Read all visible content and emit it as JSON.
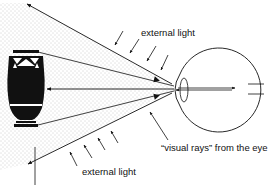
{
  "labels": {
    "external_light_top": "external light",
    "external_light_bottom": "external light",
    "visual_rays": "“visual rays” from the eye"
  },
  "colors": {
    "ink": "#111111",
    "stipple": "#b8b8b8",
    "background": "#ffffff"
  },
  "elements": {
    "object": "vase",
    "observer": "eye",
    "cone": "visual-ray-cone"
  }
}
